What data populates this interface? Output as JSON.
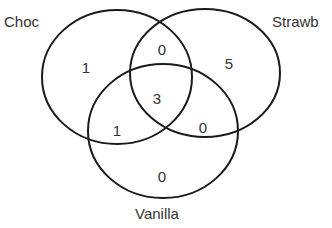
{
  "diagram": {
    "type": "venn",
    "sets": [
      {
        "name": "Choc",
        "cx": 117,
        "cy": 77,
        "rx": 75,
        "ry": 67,
        "label_x": 4,
        "label_y": 27
      },
      {
        "name": "Strawb",
        "cx": 205,
        "cy": 73,
        "rx": 75,
        "ry": 64,
        "label_x": 272,
        "label_y": 27
      },
      {
        "name": "Vanilla",
        "cx": 163,
        "cy": 131,
        "rx": 75,
        "ry": 67,
        "label_x": 135,
        "label_y": 219
      }
    ],
    "regions": [
      {
        "id": "choc_only",
        "sets": [
          "Choc"
        ],
        "value": "1",
        "x": 86,
        "y": 73
      },
      {
        "id": "choc_strawb",
        "sets": [
          "Choc",
          "Strawb"
        ],
        "value": "0",
        "x": 162,
        "y": 55
      },
      {
        "id": "strawb_only",
        "sets": [
          "Strawb"
        ],
        "value": "5",
        "x": 229,
        "y": 69
      },
      {
        "id": "all_three",
        "sets": [
          "Choc",
          "Strawb",
          "Vanilla"
        ],
        "value": "3",
        "x": 157,
        "y": 104
      },
      {
        "id": "choc_vanilla",
        "sets": [
          "Choc",
          "Vanilla"
        ],
        "value": "1",
        "x": 117,
        "y": 136
      },
      {
        "id": "strawb_vanilla",
        "sets": [
          "Strawb",
          "Vanilla"
        ],
        "value": "0",
        "x": 203,
        "y": 133
      },
      {
        "id": "vanilla_only",
        "sets": [
          "Vanilla"
        ],
        "value": "0",
        "x": 162,
        "y": 182
      }
    ],
    "stroke_color": "#1a1a1a",
    "text_color": "#333333"
  }
}
